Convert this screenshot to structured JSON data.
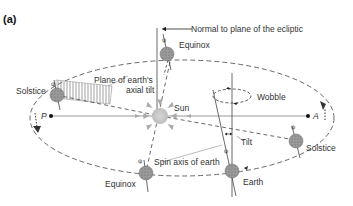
{
  "figure": {
    "panel_label": "(a)"
  },
  "labels": {
    "normal": "Normal to plane of the ecliptic",
    "equinox_top": "Equinox",
    "solstice_left": "Solstice",
    "plane_line1": "Plane of earth's",
    "plane_line2": "axial tilt",
    "sun": "Sun",
    "wobble": "Wobble",
    "perihelion": "P",
    "aphelion": "A",
    "tilt": "Tilt",
    "spin_axis": "Spin axis of earth",
    "solstice_right": "Solstice",
    "equinox_bottom": "Equinox",
    "earth": "Earth"
  },
  "colors": {
    "line": "#444444",
    "earth_fill": "#9a9a9a",
    "sun_fill": "#c8c8c8",
    "sun_rays": "#aaaaaa",
    "text": "#333333"
  }
}
